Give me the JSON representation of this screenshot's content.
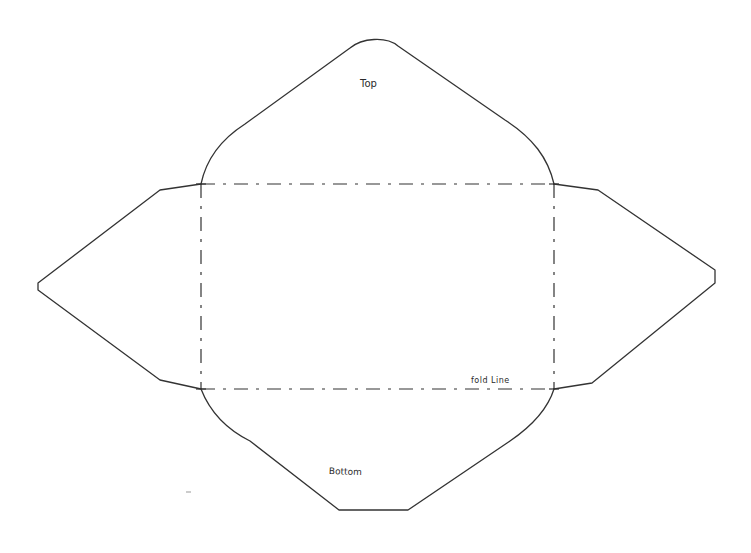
{
  "diagram": {
    "type": "envelope-template",
    "labels": {
      "top": "Top",
      "fold_line": "fold Line",
      "bottom": "Bottom"
    },
    "colors": {
      "background": "#ffffff",
      "outline": "#333333",
      "fold_line": "#333333"
    },
    "parts": [
      {
        "name": "top-flap",
        "label": "Top"
      },
      {
        "name": "bottom-flap",
        "label": "Bottom"
      },
      {
        "name": "left-flap",
        "label": ""
      },
      {
        "name": "right-flap",
        "label": ""
      },
      {
        "name": "center-panel",
        "label": "fold Line"
      }
    ]
  }
}
